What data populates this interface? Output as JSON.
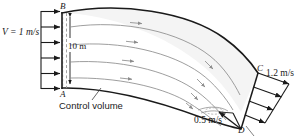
{
  "figure": {
    "name": "control-volume-curved-channel",
    "labels": {
      "inlet_velocity": "V = 1 m/s",
      "point_b": "B",
      "point_a": "A",
      "channel_width": "10 m",
      "control_volume": "Control volume",
      "point_c": "C",
      "point_d": "D",
      "outlet_velocity_outer": "1.2 m/s",
      "outlet_velocity_inner": "0.5 m/s"
    },
    "colors": {
      "line": "#1a1a1a",
      "streamline": "#8c8c8c",
      "fill": "#f4f4f4",
      "dashed": "#9a9a9a",
      "background": "#ffffff"
    },
    "geometry": {
      "inlet_arrow_count": 6,
      "streamline_count": 4,
      "outlet_arrow_count": 4,
      "inlet_face": "A-B",
      "outlet_face": "C-D"
    }
  }
}
